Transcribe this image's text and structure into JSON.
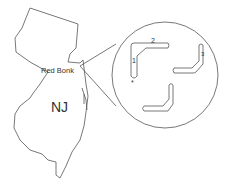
{
  "diagram": {
    "state_label": "NJ",
    "location_label": "Red Bonk",
    "inset_labels": [
      "1",
      "2",
      "3"
    ],
    "inset_marker": "*",
    "colors": {
      "stroke": "#555555",
      "text": "#333333",
      "background": "#ffffff"
    }
  }
}
